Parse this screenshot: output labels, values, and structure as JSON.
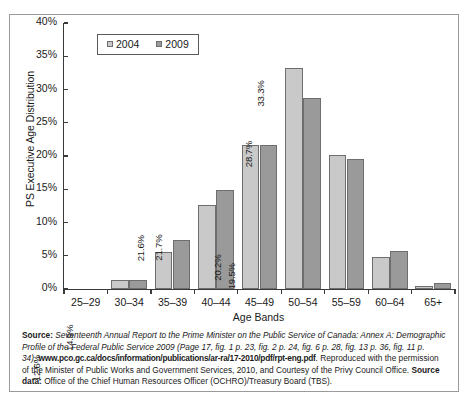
{
  "chart_data": {
    "type": "bar",
    "title": "",
    "xlabel": "Age Bands",
    "ylabel": "PS Executive Age Distribution",
    "categories": [
      "25–29",
      "30–34",
      "35–39",
      "40–44",
      "45–49",
      "50–54",
      "55–59",
      "60–64",
      "65+"
    ],
    "series": [
      {
        "name": "2004",
        "color": "#c9c9c9",
        "values": [
          0.0,
          1.3,
          5.6,
          12.6,
          21.6,
          33.3,
          20.2,
          4.8,
          0.5
        ],
        "labels": [
          "0.0%",
          "1.3%",
          "5.6%",
          "12.6%",
          "21.6%",
          "33.3%",
          "20.2%",
          "4.8%",
          "0.5%"
        ]
      },
      {
        "name": "2009",
        "color": "#9a9a9a",
        "values": [
          0.0,
          1.4,
          7.3,
          14.9,
          21.7,
          28.7,
          19.5,
          5.7,
          0.9
        ],
        "labels": [
          "0.0%",
          "1.4%",
          "7.3%",
          "14.9%",
          "21.7%",
          "28.7%",
          "19.5%",
          "5.7%",
          "0.9%"
        ]
      }
    ],
    "ylim": [
      0,
      40
    ],
    "yticks": [
      0,
      5,
      10,
      15,
      20,
      25,
      30,
      35,
      40
    ],
    "ytick_labels": [
      "0%",
      "5%",
      "10%",
      "15%",
      "20%",
      "25%",
      "30%",
      "35%",
      "40%"
    ],
    "grid": false,
    "legend_position": "top-left",
    "value_labels_rotated": true
  },
  "caption": {
    "source_label": "Source:",
    "source_italic_1": "Seventeenth Annual Report to the Prime Minister on the Public Service of Canada: Annex A: Demographic Profile of the Federal Public Service 2009",
    "source_paren": "(Page 17, fig. 1 p. 23, fig. 2 p. 24, fig. 6 p. 28, fig. 13 p. 36, fig. 11 p. 34),",
    "url": "www.pco.gc.ca/docs/information/publications/ar-ra/17-2010/pdf/rpt-eng.pdf",
    "reproduced_text": ". Reproduced with the permission of the Minister of Public Works and Government Services, 2010, and Courtesy of the Privy Council Office.",
    "source_data_label": "Source data:",
    "source_data_text": "Office of the Chief Human Resources Officer (OCHRO)/Treasury Board (TBS)."
  }
}
